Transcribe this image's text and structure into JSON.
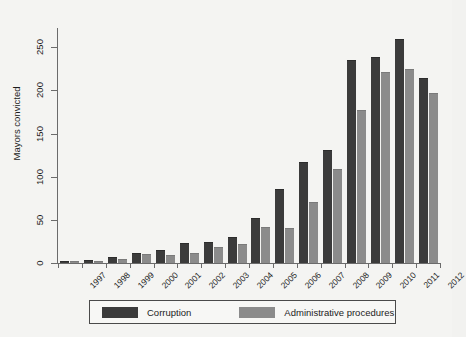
{
  "chart_data": {
    "type": "bar",
    "title": "",
    "subtitle": "",
    "xlabel": "",
    "ylabel": "Mayors convicted",
    "categories": [
      "1997",
      "1998",
      "1999",
      "2000",
      "2001",
      "2002",
      "2003",
      "2004",
      "2005",
      "2006",
      "2007",
      "2008",
      "2009",
      "2010",
      "2011",
      "2012"
    ],
    "series": [
      {
        "name": "Corruption",
        "color": "#3b3b3b",
        "values": [
          1,
          2,
          6,
          10,
          14,
          22,
          23,
          29,
          51,
          85,
          116,
          130,
          234,
          238,
          258,
          213
        ]
      },
      {
        "name": "Administrative procedures",
        "color": "#8b8b8b",
        "values": [
          1,
          1,
          3,
          9,
          8,
          11,
          17,
          21,
          41,
          39,
          69,
          108,
          176,
          220,
          224,
          196
        ]
      }
    ],
    "yticks": [
      0,
      50,
      100,
      150,
      200,
      250
    ],
    "ylim": [
      0,
      270
    ],
    "grid": false,
    "legend_position": "bottom",
    "legend": [
      "Corruption",
      "Administrative procedures"
    ]
  },
  "figure": {
    "background_color": "#f4f4f2",
    "axis_color": "#6b6b6b"
  }
}
